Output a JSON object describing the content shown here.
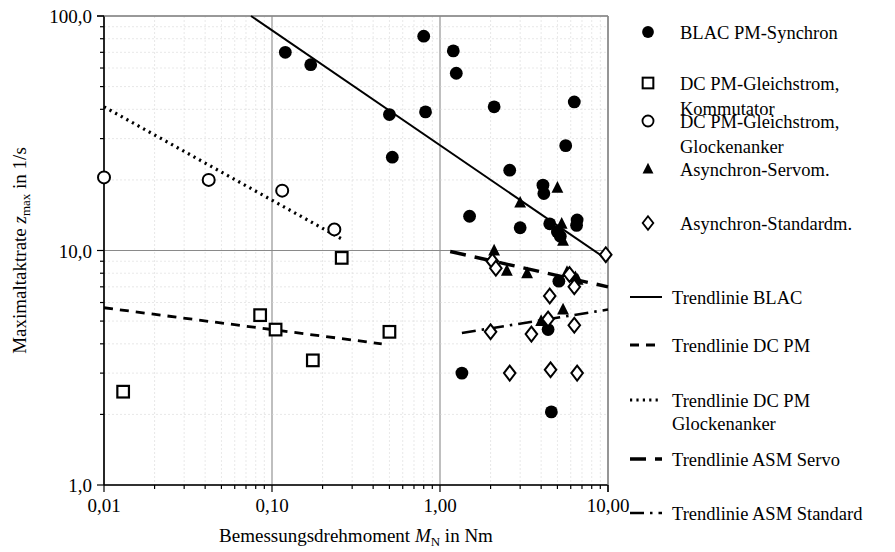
{
  "chart_data": {
    "type": "scatter",
    "title": "",
    "xlabel": "Bemessungsdrehmoment M_N in Nm",
    "xlabel_main": "Bemessungsdrehmoment",
    "xlabel_symbol": "M",
    "xlabel_symbol_sub": "N",
    "xlabel_unit": "in Nm",
    "ylabel": "Maximaltaktrate z_max in 1/s",
    "ylabel_main": "Maximaltaktrate",
    "ylabel_symbol": "z",
    "ylabel_symbol_sub": "max",
    "ylabel_unit": "in 1/s",
    "xscale": "log",
    "yscale": "log",
    "xlim": [
      0.01,
      10.0
    ],
    "ylim": [
      1.0,
      100.0
    ],
    "grid": true,
    "legend_position": "right",
    "xticks": [
      {
        "value": 0.01,
        "label": "0,01"
      },
      {
        "value": 0.1,
        "label": "0,10"
      },
      {
        "value": 1.0,
        "label": "1,00"
      },
      {
        "value": 10.0,
        "label": "10,00"
      }
    ],
    "yticks": [
      {
        "value": 100.0,
        "label": "100,0"
      },
      {
        "value": 10.0,
        "label": "10,0"
      },
      {
        "value": 1.0,
        "label": "1,0"
      }
    ],
    "series": [
      {
        "name": "BLAC PM-Synchron",
        "marker": "filled-circle",
        "points": [
          [
            0.12,
            70.0
          ],
          [
            0.17,
            62.0
          ],
          [
            0.5,
            38.0
          ],
          [
            0.52,
            25.0
          ],
          [
            0.8,
            82.0
          ],
          [
            0.82,
            39.0
          ],
          [
            1.2,
            71.0
          ],
          [
            1.25,
            57.0
          ],
          [
            1.5,
            14.0
          ],
          [
            2.1,
            41.0
          ],
          [
            2.6,
            22.0
          ],
          [
            3.0,
            12.5
          ],
          [
            4.1,
            19.0
          ],
          [
            4.15,
            17.5
          ],
          [
            4.5,
            13.0
          ],
          [
            5.0,
            12.0
          ],
          [
            5.2,
            11.5
          ],
          [
            5.6,
            28.0
          ],
          [
            6.3,
            43.0
          ],
          [
            6.5,
            12.8
          ],
          [
            6.55,
            13.5
          ],
          [
            5.1,
            7.4
          ],
          [
            1.35,
            3.0
          ],
          [
            4.4,
            4.6
          ],
          [
            4.6,
            2.05
          ]
        ]
      },
      {
        "name": "DC PM-Gleichstrom, Kommutator",
        "marker": "open-square",
        "points": [
          [
            0.013,
            2.5
          ],
          [
            0.085,
            5.3
          ],
          [
            0.105,
            4.6
          ],
          [
            0.175,
            3.4
          ],
          [
            0.26,
            9.3
          ],
          [
            0.5,
            4.5
          ]
        ]
      },
      {
        "name": "DC PM-Gleichstrom, Glockenanker",
        "marker": "open-circle",
        "points": [
          [
            0.01,
            20.5
          ],
          [
            0.042,
            20.0
          ],
          [
            0.115,
            18.0
          ],
          [
            0.235,
            12.3
          ]
        ]
      },
      {
        "name": "Asynchron-Servom.",
        "marker": "filled-triangle",
        "points": [
          [
            2.1,
            10.0
          ],
          [
            3.0,
            16.0
          ],
          [
            2.5,
            8.2
          ],
          [
            3.3,
            8.0
          ],
          [
            5.0,
            18.5
          ],
          [
            5.3,
            13.0
          ],
          [
            5.4,
            11.0
          ],
          [
            5.7,
            8.1
          ],
          [
            6.4,
            7.7
          ],
          [
            4.0,
            5.0
          ],
          [
            5.4,
            5.6
          ],
          [
            6.6,
            7.5
          ]
        ]
      },
      {
        "name": "Asynchron-Standardm.",
        "marker": "open-diamond",
        "points": [
          [
            2.05,
            9.0
          ],
          [
            2.15,
            8.4
          ],
          [
            4.5,
            6.4
          ],
          [
            5.9,
            7.9
          ],
          [
            6.3,
            7.0
          ],
          [
            2.0,
            4.5
          ],
          [
            3.5,
            4.4
          ],
          [
            4.4,
            5.1
          ],
          [
            6.3,
            4.8
          ],
          [
            4.55,
            3.1
          ],
          [
            6.55,
            3.0
          ],
          [
            9.7,
            9.6
          ],
          [
            2.6,
            3.0
          ]
        ]
      }
    ],
    "trendlines": [
      {
        "name": "Trendlinie BLAC",
        "style": "solid",
        "x_start": 0.075,
        "y_start": 100.0,
        "x_end": 10.0,
        "y_end": 9.1
      },
      {
        "name": "Trendlinie DC PM",
        "style": "dashed",
        "x_start": 0.01,
        "y_start": 5.7,
        "x_end": 0.45,
        "y_end": 4.0
      },
      {
        "name": "Trendlinie DC PM Glockenanker",
        "style": "dotted",
        "x_start": 0.01,
        "y_start": 41.0,
        "x_end": 0.26,
        "y_end": 11.2
      },
      {
        "name": "Trendlinie ASM Servo",
        "style": "long-dashed",
        "x_start": 1.15,
        "y_start": 9.9,
        "x_end": 10.0,
        "y_end": 7.0
      },
      {
        "name": "Trendlinie ASM Standard",
        "style": "dash-dot",
        "x_start": 1.35,
        "y_start": 4.45,
        "x_end": 10.0,
        "y_end": 5.6
      }
    ]
  },
  "legend": {
    "markers": [
      {
        "label": "BLAC PM-Synchron",
        "marker": "filled-circle"
      },
      {
        "label": "DC PM-Gleichstrom,",
        "label2": "Kommutator",
        "marker": "open-square"
      },
      {
        "label": "DC PM-Gleichstrom,",
        "label2": "Glockenanker",
        "marker": "open-circle"
      },
      {
        "label": "Asynchron-Servom.",
        "marker": "filled-triangle"
      },
      {
        "label": "Asynchron-Standardm.",
        "marker": "open-diamond"
      }
    ],
    "lines": [
      {
        "label": "Trendlinie BLAC",
        "style": "solid"
      },
      {
        "label": "Trendlinie DC PM",
        "style": "dashed"
      },
      {
        "label": "Trendlinie DC PM",
        "label2": "Glockenanker",
        "style": "dotted"
      },
      {
        "label": "Trendlinie ASM Servo",
        "style": "long-dashed"
      },
      {
        "label": "Trendlinie ASM Standard",
        "style": "dash-dot"
      }
    ]
  },
  "colors": {
    "ink": "#000000",
    "grid": "#c8c8c8",
    "grid_minor": "#d8d8d8",
    "background": "#ffffff"
  }
}
